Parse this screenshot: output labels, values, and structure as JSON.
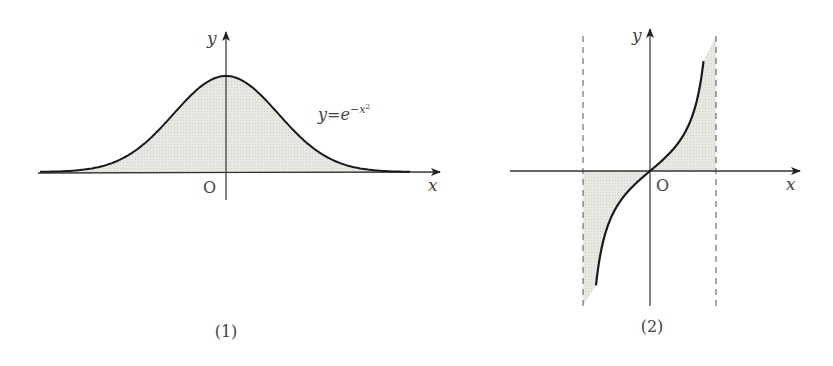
{
  "figures": [
    {
      "id": "1",
      "caption": "(1)",
      "function_label": "y=e",
      "function_exponent": "−x",
      "function_exponent_power": "2",
      "axis_x_label": "x",
      "axis_y_label": "y",
      "origin_label": "O",
      "description": "Gaussian curve y = e^{-x^2} with shaded area between curve and x-axis"
    },
    {
      "id": "2",
      "caption": "(2)",
      "axis_x_label": "x",
      "axis_y_label": "y",
      "origin_label": "O",
      "description": "Increasing odd curve between two vertical dashed asymptotes, shaded between curve and x-axis"
    }
  ],
  "colors": {
    "curve": "#1a1a1a",
    "axis": "#333333",
    "fill": "#e4e6df",
    "dashed": "#555555",
    "text": "#444444"
  }
}
